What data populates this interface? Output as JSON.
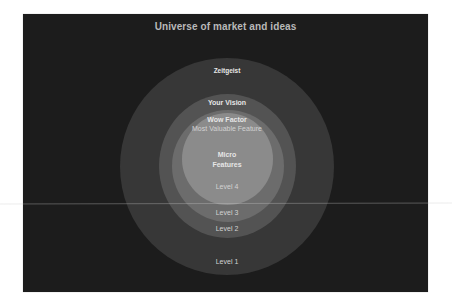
{
  "diagram": {
    "title": "Universe of market and ideas",
    "colors": {
      "background": "#1c1c1c",
      "level1": "#373737",
      "level2": "#535353",
      "level3": "#6c6c6c",
      "level4": "#8b8b8b",
      "text": "#e6e6e6"
    },
    "rings": [
      {
        "id": "level1",
        "header": "Zeitgeist",
        "level_label": "Level 1"
      },
      {
        "id": "level2",
        "header": "Your Vision",
        "level_label": "Level 2"
      },
      {
        "id": "level3",
        "header": "Wow Factor",
        "subheader": "Most Valuable Feature",
        "level_label": "Level 3"
      },
      {
        "id": "level4",
        "header_line1": "Micro",
        "header_line2": "Features",
        "level_label": "Level 4"
      }
    ]
  }
}
